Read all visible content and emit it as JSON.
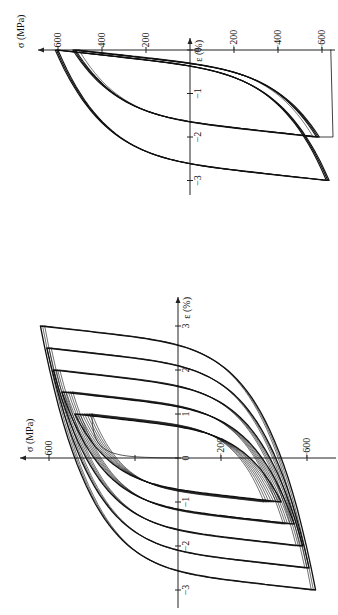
{
  "figure": {
    "rotation_deg": -90,
    "caption_partial": ""
  },
  "chart_data": [
    {
      "type": "line",
      "name": "strain-controlled-cycles-offset",
      "title": "",
      "xlabel": "ε (%)",
      "ylabel": "σ (MPa)",
      "x_ticks": [
        0,
        -1,
        -2,
        -3
      ],
      "x_tick_labels": [
        "0",
        "−1",
        "−2",
        "−3"
      ],
      "y_ticks": [
        600,
        400,
        200,
        -200,
        -400,
        -600
      ],
      "y_tick_labels": [
        "600",
        "400",
        "200",
        "−200",
        "−400",
        "−600"
      ],
      "xlim": [
        -3.3,
        0.5
      ],
      "ylim": [
        -700,
        700
      ],
      "grid": false,
      "legend": "none",
      "series": [
        {
          "name": "loop 0 to -2 % (first cycles)",
          "strain_max": 0,
          "strain_min": -2.0,
          "sigma_max": 520,
          "sigma_min": -575,
          "copies": 3,
          "stroke": 1.6
        },
        {
          "name": "loop 0 to -2 % (stabilized)",
          "strain_max": 0,
          "strain_min": -2.0,
          "sigma_max": 505,
          "sigma_min": -560,
          "copies": 1,
          "stroke": 0.8
        },
        {
          "name": "loop 0 to -3 %",
          "strain_max": 0,
          "strain_min": -3.0,
          "sigma_max": 600,
          "sigma_min": -620,
          "copies": 3,
          "stroke": 1.6
        }
      ],
      "layout": {
        "x0": 190,
        "y0": 50,
        "px_per_mpa": 0.22,
        "px_per_pct": 43.5,
        "sigma_axis": [
          38,
          335
        ],
        "eps_axis": [
          38,
          195
        ]
      }
    },
    {
      "type": "line",
      "name": "symmetric-strain-amplitude-increments",
      "title": "",
      "xlabel": "ε (%)",
      "ylabel": "σ (MPa)",
      "x_ticks": [
        -3,
        -2,
        -1,
        0,
        1,
        2,
        3
      ],
      "x_tick_labels": [
        "−3",
        "−2",
        "−1",
        "0",
        "1",
        "2",
        "3"
      ],
      "y_ticks": [
        600,
        200,
        -200,
        -600
      ],
      "y_tick_labels": [
        "600",
        "",
        "−200",
        "−600"
      ],
      "xlim": [
        -3.5,
        3.5
      ],
      "ylim": [
        -700,
        700
      ],
      "grid": false,
      "legend": "none",
      "series": [
        {
          "name": "amplitude 1.0 %",
          "strain_amp": 1.0,
          "sigma_amp_first": 400,
          "sigma_amp_last": 480,
          "copies": 8
        },
        {
          "name": "amplitude 1.5 %",
          "strain_amp": 1.5,
          "sigma_amp_first": 490,
          "sigma_amp_last": 540,
          "copies": 6
        },
        {
          "name": "amplitude 2.0 %",
          "strain_amp": 2.0,
          "sigma_amp_first": 550,
          "sigma_amp_last": 580,
          "copies": 4
        },
        {
          "name": "amplitude 2.5 %",
          "strain_amp": 2.5,
          "sigma_amp_first": 590,
          "sigma_amp_last": 610,
          "copies": 3
        },
        {
          "name": "amplitude 3.0 %",
          "strain_amp": 3.0,
          "sigma_amp_first": 620,
          "sigma_amp_last": 640,
          "copies": 3
        }
      ],
      "initial_loading": {
        "strain_end": 1.0,
        "sigma_end": 400
      },
      "layout": {
        "x0": 178,
        "y0": 458,
        "px_per_mpa": 0.215,
        "px_per_pct": 44,
        "sigma_axis": [
          20,
          336
        ],
        "eps_axis": [
          297,
          608
        ]
      }
    }
  ]
}
